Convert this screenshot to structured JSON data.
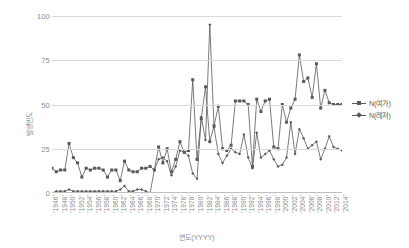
{
  "chart_data": {
    "type": "line",
    "title": "",
    "xlabel": "연도(YYYY)",
    "ylabel": "발생빈도",
    "ylim": [
      0,
      100
    ],
    "yticks": [
      0,
      25,
      50,
      75,
      100
    ],
    "grid": true,
    "legend_position": "right",
    "xtick_step": 2,
    "x": [
      1946,
      1947,
      1948,
      1949,
      1950,
      1951,
      1952,
      1953,
      1954,
      1955,
      1956,
      1957,
      1958,
      1959,
      1960,
      1961,
      1962,
      1963,
      1964,
      1965,
      1966,
      1967,
      1968,
      1969,
      1970,
      1971,
      1972,
      1973,
      1974,
      1975,
      1976,
      1977,
      1978,
      1979,
      1980,
      1981,
      1982,
      1983,
      1984,
      1985,
      1986,
      1987,
      1988,
      1989,
      1990,
      1991,
      1992,
      1993,
      1994,
      1995,
      1996,
      1997,
      1998,
      1999,
      2000,
      2001,
      2002,
      2003,
      2004,
      2005,
      2006,
      2007,
      2008,
      2009,
      2010,
      2011,
      2012,
      2013,
      2014
    ],
    "xtick_labels": [
      "'1946'",
      "'1948'",
      "'1950'",
      "'1952'",
      "'1954'",
      "'1956'",
      "'1958'",
      "'1960'",
      "'1962'",
      "'1964'",
      "'1966'",
      "'1968'",
      "'1970'",
      "'1972'",
      "'1974'",
      "'1976'",
      "'1978'",
      "'1980'",
      "'1982'",
      "'1984'",
      "'1986'",
      "'1988'",
      "'1990'",
      "'1992'",
      "'1994'",
      "'1996'",
      "'1998'",
      "'2000'",
      "'2002'",
      "'2004'",
      "'2006'",
      "'2008'",
      "'2010'",
      "'2012'",
      "'2014'"
    ],
    "series": [
      {
        "name": "N(여가)",
        "color": "#595959",
        "marker": "square",
        "values": [
          14,
          12,
          13,
          13,
          28,
          20,
          17,
          9,
          14,
          13,
          14,
          14,
          13,
          9,
          13,
          13,
          7,
          18,
          13,
          12,
          12,
          14,
          14,
          15,
          13,
          26,
          17,
          25,
          12,
          19,
          29,
          23,
          24,
          64,
          19,
          42,
          60,
          29,
          38,
          49,
          25,
          24,
          27,
          52,
          52,
          52,
          50,
          15,
          53,
          46,
          52,
          53,
          26,
          25,
          50,
          40,
          48,
          53,
          78,
          63,
          65,
          54,
          73,
          48,
          58,
          51,
          50,
          50,
          50
        ]
      },
      {
        "name": "N(레저)",
        "color": "#595959",
        "marker": "diamond",
        "values": [
          0,
          1,
          1,
          1,
          2,
          1,
          1,
          1,
          1,
          1,
          1,
          1,
          1,
          1,
          1,
          1,
          2,
          4,
          1,
          1,
          2,
          2,
          1,
          0,
          13,
          19,
          20,
          18,
          10,
          15,
          24,
          23,
          21,
          11,
          8,
          43,
          30,
          95,
          37,
          22,
          17,
          21,
          25,
          23,
          22,
          33,
          20,
          14,
          34,
          20,
          22,
          24,
          19,
          15,
          16,
          20,
          40,
          22,
          36,
          31,
          25,
          27,
          29,
          19,
          25,
          32,
          26,
          25,
          24
        ]
      }
    ]
  },
  "legend": {
    "items": [
      {
        "label": "N(여가)"
      },
      {
        "label": "N(레저)"
      }
    ]
  }
}
